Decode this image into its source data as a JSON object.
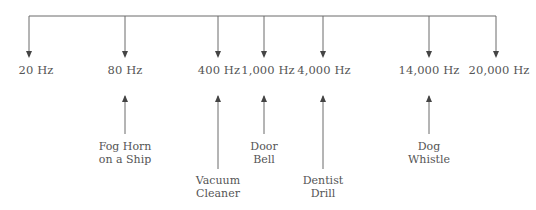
{
  "diagram": {
    "type": "frequency-scale",
    "frequencies": [
      {
        "label": "20 Hz",
        "x": 36
      },
      {
        "label": "80 Hz",
        "x": 125
      },
      {
        "label": "400 Hz",
        "x": 219
      },
      {
        "label": "1,000 Hz",
        "x": 267
      },
      {
        "label": "4,000 Hz",
        "x": 324
      },
      {
        "label": "14,000 Hz",
        "x": 429
      },
      {
        "label": "20,000 Hz",
        "x": 499
      }
    ],
    "sources": [
      {
        "line1": "Fog Horn",
        "line2": "on a Ship",
        "frequency": "80 Hz"
      },
      {
        "line1": "Vacuum",
        "line2": "Cleaner",
        "frequency": "400 Hz"
      },
      {
        "line1": "Door",
        "line2": "Bell",
        "frequency": "1,000 Hz"
      },
      {
        "line1": "Dentist",
        "line2": "Drill",
        "frequency": "4,000 Hz"
      },
      {
        "line1": "Dog",
        "line2": "Whistle",
        "frequency": "14,000 Hz"
      }
    ],
    "colors": {
      "line": "#6b6b6b",
      "text": "#555555"
    }
  }
}
